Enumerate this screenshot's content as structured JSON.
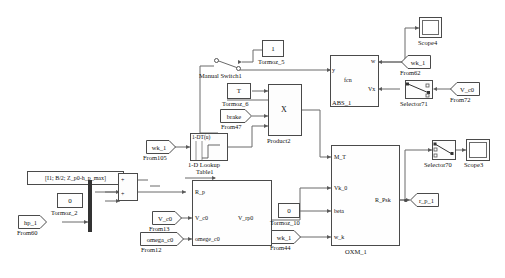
{
  "diagram": {
    "blocks": {
      "tormoz_5": {
        "label": "Tormoz_5",
        "value": "1"
      },
      "manual_switch": {
        "label": "Manual Switch1"
      },
      "tormoz_6": {
        "label": "Tormoz_6",
        "value": "T"
      },
      "from47": {
        "label": "From47",
        "tag": "brake"
      },
      "abs_1": {
        "label": "ABS_1",
        "fcn": "fcn",
        "in_y": "y",
        "in_w": "w",
        "in_vx": "Vx"
      },
      "scope4": {
        "label": "Scope4"
      },
      "from62": {
        "label": "From62",
        "tag": "wk_1"
      },
      "selector71": {
        "label": "Selector71"
      },
      "from72": {
        "label": "From72",
        "tag": "V_c0"
      },
      "product2": {
        "label": "Product2",
        "op": "X"
      },
      "from105": {
        "label": "From105",
        "tag": "wk_1"
      },
      "lookup1": {
        "label": "1-D Lookup",
        "label2": "Table1",
        "expr": "1-DT(u)"
      },
      "oxm_1": {
        "label": "OXM_1",
        "in_m_t": "M_T",
        "in_vk_0": "Vk_0",
        "in_beta": "beta",
        "in_w_k": "w_k",
        "out_r_psk": "R_Psk"
      },
      "goto_rp1": {
        "tag": "r_p_1"
      },
      "selector70": {
        "label": "Selector70"
      },
      "scope3": {
        "label": "Scope3"
      },
      "const_vec": {
        "value": "[I1; B/2; Z_p0-h_p_max]"
      },
      "tormoz_2": {
        "label": "Tormoz_2",
        "value": "0"
      },
      "from60": {
        "label": "From60",
        "tag": "hp_1"
      },
      "rp_block": {
        "in_r_p": "R_p",
        "in_v_c0": "V_c0",
        "in_omege_c0": "omege_c0",
        "out_v_rp0": "V_rp0"
      },
      "from13": {
        "label": "From13",
        "tag": "V_c0"
      },
      "from12": {
        "label": "From12",
        "tag": "omega_c0"
      },
      "tormoz_10": {
        "label": "Tormoz_10",
        "value": "0"
      },
      "from44": {
        "label": "From44",
        "tag": "wk_1"
      }
    },
    "colors": {
      "line": "#6a6a6a",
      "block_border": "#4a4a4a",
      "background": "#ffffff",
      "text": "#111111"
    }
  }
}
